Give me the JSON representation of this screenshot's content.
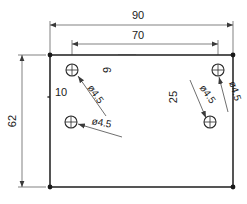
{
  "drawing": {
    "title": "Mounting plate hole pattern drawing",
    "units_note": "",
    "canvas": {
      "width": 247,
      "height": 204
    },
    "plate": {
      "name": "rectangular-plate-outline",
      "x": 50,
      "y": 55,
      "width": 183,
      "height": 132
    },
    "dimensions": [
      {
        "id": "overall-width",
        "label": "90",
        "orientation": "horizontal",
        "text_x": 138,
        "text_y": 16,
        "line_y": 25,
        "x1": 50,
        "x2": 233
      },
      {
        "id": "hole-span-width",
        "label": "70",
        "orientation": "horizontal",
        "text_x": 138,
        "text_y": 36,
        "line_y": 44,
        "x1": 72,
        "x2": 218
      },
      {
        "id": "overall-height",
        "label": "62",
        "orientation": "vertical",
        "text_x": 16,
        "text_y": 121,
        "line_x": 22,
        "y1": 55,
        "y2": 187
      },
      {
        "id": "top-hole-edge-offset",
        "label": "9",
        "orientation": "vertical",
        "text_x": 110,
        "text_y": 70,
        "line_x": 118,
        "y1": 55,
        "y2": 70
      },
      {
        "id": "left-hole-edge-offset",
        "label": "10",
        "orientation": "horizontal",
        "text_x": 60,
        "text_y": 93,
        "line_y": 97,
        "x1": 47,
        "x2": 78
      },
      {
        "id": "right-hole-vertical-spacing",
        "label": "25",
        "orientation": "vertical",
        "text_x": 176,
        "text_y": 96,
        "line_x": 184,
        "y1": 71,
        "y2": 122
      }
    ],
    "holes": [
      {
        "id": "hole-top-left",
        "cx": 72,
        "cy": 70,
        "r": 6,
        "diameter_label": "ø4.5",
        "label_x": 93,
        "label_y": 94,
        "label_rotation": 55,
        "leader_from_x": 106,
        "leader_from_y": 116,
        "leader_to_x": 78,
        "leader_to_y": 76
      },
      {
        "id": "hole-bottom-left",
        "cx": 71,
        "cy": 122,
        "r": 6,
        "diameter_label": "ø4.5",
        "label_x": 93,
        "label_y": 126,
        "label_rotation": 10,
        "leader_from_x": 122,
        "leader_from_y": 137,
        "leader_to_x": 78,
        "leader_to_y": 124
      },
      {
        "id": "hole-top-right",
        "cx": 218,
        "cy": 70,
        "r": 6,
        "diameter_label": "ø4.5",
        "label_x": 230,
        "label_y": 90,
        "label_rotation": 72,
        "leader_from_x": 228,
        "leader_from_y": 112,
        "leader_to_x": 220,
        "leader_to_y": 77
      },
      {
        "id": "hole-bottom-right",
        "cx": 210,
        "cy": 122,
        "r": 6,
        "diameter_label": "ø4.5",
        "label_x": 207,
        "label_y": 96,
        "label_rotation": 55,
        "leader_from_x": 192,
        "leader_from_y": 82,
        "leader_to_x": 206,
        "leader_to_y": 118
      }
    ],
    "colors": {
      "outline": "#2b2b2b",
      "thin_line": "#4a4a4a",
      "text": "#1a1a1a",
      "background": "#ffffff"
    }
  }
}
